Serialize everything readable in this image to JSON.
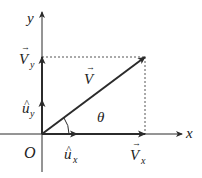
{
  "diagram": {
    "colors": {
      "line": "#2b2b2b",
      "dashed": "#555555",
      "text": "#222222"
    },
    "axes": {
      "x_label": "x",
      "y_label": "y",
      "origin_label": "O"
    },
    "vector": {
      "label": "V",
      "arrow_mark": "→"
    },
    "components": {
      "vx": {
        "label": "V",
        "subscript": "x",
        "arrow_mark": "→"
      },
      "vy": {
        "label": "V",
        "subscript": "y",
        "arrow_mark": "→"
      }
    },
    "unit_vectors": {
      "ux": {
        "label": "u",
        "subscript": "x",
        "hat": "^"
      },
      "uy": {
        "label": "u",
        "subscript": "y",
        "hat": "^"
      }
    },
    "angle": {
      "label": "θ"
    }
  }
}
